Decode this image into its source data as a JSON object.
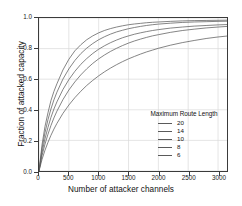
{
  "chart_data": {
    "type": "line",
    "title": "",
    "xlabel": "Number of attacker channels",
    "ylabel": "Fraction of attacked capacity",
    "xlim": [
      0,
      3150
    ],
    "ylim": [
      0.0,
      1.0
    ],
    "xticks": [
      0,
      500,
      1000,
      1500,
      2000,
      2500,
      3000
    ],
    "xticklabels": [
      "0",
      "500",
      "1000",
      "1500",
      "2000",
      "2500",
      "3000"
    ],
    "yticks": [
      0.0,
      0.2,
      0.4,
      0.6,
      0.8,
      1.0
    ],
    "yticklabels": [
      "0.0",
      "0.2",
      "0.4",
      "0.6",
      "0.8",
      "1.0"
    ],
    "grid": true,
    "grid_color": "#d9d9d9",
    "legend_title": "Maximum Route Length",
    "legend_position": "lower right",
    "line_color": "#5a5a5a",
    "axis_color": "#3b3b3b",
    "x": [
      0,
      50,
      100,
      150,
      200,
      250,
      300,
      400,
      500,
      600,
      700,
      800,
      900,
      1000,
      1100,
      1200,
      1300,
      1400,
      1500,
      1600,
      1700,
      1800,
      1900,
      2000,
      2200,
      2400,
      2600,
      2800,
      3000,
      3150
    ],
    "series": [
      {
        "name": "20",
        "values": [
          0.0,
          0.17,
          0.29,
          0.38,
          0.46,
          0.52,
          0.57,
          0.66,
          0.73,
          0.785,
          0.825,
          0.858,
          0.883,
          0.903,
          0.919,
          0.931,
          0.941,
          0.949,
          0.956,
          0.961,
          0.965,
          0.969,
          0.972,
          0.974,
          0.978,
          0.981,
          0.983,
          0.984,
          0.985,
          0.986
        ]
      },
      {
        "name": "14",
        "values": [
          0.0,
          0.145,
          0.25,
          0.335,
          0.405,
          0.465,
          0.515,
          0.6,
          0.667,
          0.722,
          0.767,
          0.803,
          0.833,
          0.858,
          0.878,
          0.895,
          0.909,
          0.92,
          0.93,
          0.938,
          0.945,
          0.951,
          0.956,
          0.96,
          0.966,
          0.971,
          0.974,
          0.976,
          0.978,
          0.979
        ]
      },
      {
        "name": "10",
        "values": [
          0.0,
          0.12,
          0.21,
          0.285,
          0.35,
          0.405,
          0.452,
          0.532,
          0.597,
          0.651,
          0.697,
          0.735,
          0.768,
          0.796,
          0.819,
          0.839,
          0.856,
          0.871,
          0.883,
          0.894,
          0.903,
          0.911,
          0.918,
          0.924,
          0.934,
          0.941,
          0.947,
          0.951,
          0.955,
          0.957
        ]
      },
      {
        "name": "8",
        "values": [
          0.0,
          0.1,
          0.175,
          0.24,
          0.297,
          0.347,
          0.391,
          0.466,
          0.529,
          0.582,
          0.628,
          0.668,
          0.703,
          0.733,
          0.759,
          0.782,
          0.802,
          0.82,
          0.836,
          0.85,
          0.862,
          0.873,
          0.883,
          0.891,
          0.906,
          0.918,
          0.927,
          0.935,
          0.941,
          0.945
        ]
      },
      {
        "name": "6",
        "values": [
          0.0,
          0.075,
          0.135,
          0.187,
          0.233,
          0.274,
          0.311,
          0.376,
          0.431,
          0.479,
          0.521,
          0.559,
          0.592,
          0.622,
          0.649,
          0.673,
          0.695,
          0.715,
          0.733,
          0.749,
          0.764,
          0.778,
          0.79,
          0.802,
          0.822,
          0.839,
          0.853,
          0.866,
          0.876,
          0.882
        ]
      }
    ]
  }
}
